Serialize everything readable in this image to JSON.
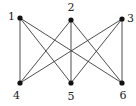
{
  "diagram": {
    "type": "bipartite-graph",
    "name": "K3,3",
    "nodes": [
      {
        "id": "1",
        "label": "1",
        "x": 20,
        "y": 18,
        "lx": 8,
        "ly": 20
      },
      {
        "id": "2",
        "label": "2",
        "x": 71,
        "y": 20,
        "lx": 67.5,
        "ly": 11
      },
      {
        "id": "3",
        "label": "3",
        "x": 122,
        "y": 19,
        "lx": 127,
        "ly": 22
      },
      {
        "id": "4",
        "label": "4",
        "x": 20,
        "y": 83,
        "lx": 13,
        "ly": 99
      },
      {
        "id": "5",
        "label": "5",
        "x": 71,
        "y": 83,
        "lx": 67.5,
        "ly": 100
      },
      {
        "id": "6",
        "label": "6",
        "x": 122,
        "y": 83,
        "lx": 119.5,
        "ly": 99
      }
    ],
    "edges": [
      [
        "1",
        "4"
      ],
      [
        "1",
        "5"
      ],
      [
        "1",
        "6"
      ],
      [
        "2",
        "4"
      ],
      [
        "2",
        "5"
      ],
      [
        "2",
        "6"
      ],
      [
        "3",
        "4"
      ],
      [
        "3",
        "5"
      ],
      [
        "3",
        "6"
      ]
    ],
    "colors": {
      "edge": "#3a3a3a",
      "node": "#111111",
      "label": "#222222",
      "background": "#ffffff"
    }
  }
}
